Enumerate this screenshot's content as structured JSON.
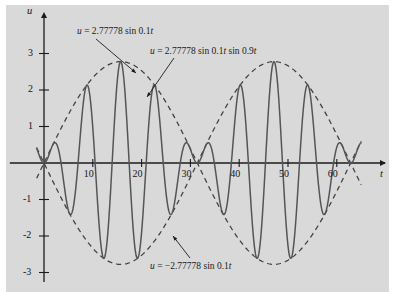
{
  "figure": {
    "panel_color": "#d9d9d9",
    "background_color": "#ffffff",
    "curve_color": "#4a4a4a",
    "axis_color": "#1b1b1b"
  },
  "axes": {
    "x_label": "t",
    "y_label": "u",
    "x_ticks": [
      10,
      20,
      30,
      40,
      50,
      60
    ],
    "x_tick_labels": [
      "10",
      "20",
      "30",
      "40",
      "50",
      "60"
    ],
    "y_ticks": [
      3,
      2,
      1,
      -1,
      -2,
      -3
    ],
    "y_tick_labels": [
      "3",
      "2",
      "1",
      "-1",
      "-2",
      "-3"
    ]
  },
  "annotations": {
    "envelope_top": "u = 2.77778 sin 0.1t",
    "beat_curve": "u = 2.77778 sin 0.1t sin 0.9t",
    "envelope_bottom": "u = −2.77778 sin 0.1t"
  },
  "chart_data": {
    "type": "line",
    "title": "",
    "xlabel": "t",
    "ylabel": "u",
    "xlim": [
      -4,
      66
    ],
    "ylim": [
      -3.4,
      3.4
    ],
    "grid": false,
    "legend": "none",
    "amplitude": 2.77778,
    "slow_frequency": 0.1,
    "fast_frequency": 0.9,
    "series": [
      {
        "name": "u = 2.77778 sin 0.1t sin 0.9t",
        "style": "solid",
        "expression": "2.77778*sin(0.1*t)*sin(0.9*t)"
      },
      {
        "name": "u = 2.77778 sin 0.1t",
        "style": "dashed",
        "expression": "2.77778*sin(0.1*t)"
      },
      {
        "name": "u = -2.77778 sin 0.1t",
        "style": "dashed",
        "expression": "-2.77778*sin(0.1*t)"
      }
    ]
  }
}
